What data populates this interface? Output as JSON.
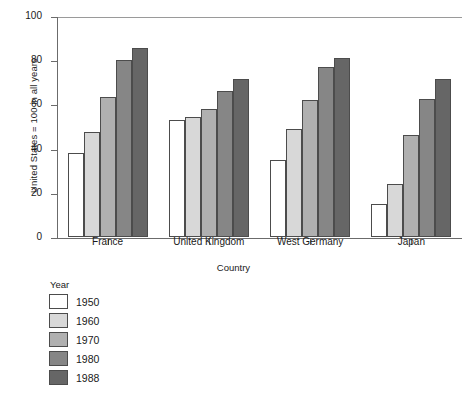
{
  "chart_data": {
    "type": "bar",
    "title": "",
    "xlabel": "Country",
    "ylabel": "United States = 100 in all years",
    "categories": [
      "France",
      "United Kingdom",
      "West Germany",
      "Japan"
    ],
    "series": [
      {
        "name": "1950",
        "color": "#ffffff",
        "values": [
          38,
          53,
          35,
          15
        ]
      },
      {
        "name": "1960",
        "color": "#d8d8d8",
        "values": [
          47.5,
          54.5,
          49,
          24
        ]
      },
      {
        "name": "1970",
        "color": "#b0b0b0",
        "values": [
          63.5,
          58,
          62,
          46
        ]
      },
      {
        "name": "1980",
        "color": "#868686",
        "values": [
          80,
          66,
          77,
          62.5
        ]
      },
      {
        "name": "1988",
        "color": "#666666",
        "values": [
          85.5,
          71.5,
          81,
          71.5
        ]
      }
    ],
    "ylim": [
      0,
      100
    ],
    "yticks": [
      0,
      20,
      40,
      60,
      80,
      100
    ],
    "grid": false,
    "legend_title": "Year",
    "legend_position": "below-left"
  }
}
